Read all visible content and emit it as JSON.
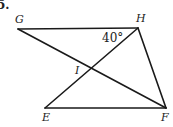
{
  "problem": {
    "number": "5."
  },
  "points": {
    "G": {
      "label": "G",
      "x": 18,
      "y": 29
    },
    "H": {
      "label": "H",
      "x": 138,
      "y": 28
    },
    "I": {
      "label": "I",
      "x": 92,
      "y": 69
    },
    "E": {
      "label": "E",
      "x": 45,
      "y": 108
    },
    "F": {
      "label": "F",
      "x": 166,
      "y": 108
    }
  },
  "segments": [
    {
      "from": "G",
      "to": "H"
    },
    {
      "from": "G",
      "to": "F"
    },
    {
      "from": "H",
      "to": "E"
    },
    {
      "from": "H",
      "to": "F"
    },
    {
      "from": "E",
      "to": "F"
    }
  ],
  "angle": {
    "vertex": "H",
    "value": "40°"
  }
}
